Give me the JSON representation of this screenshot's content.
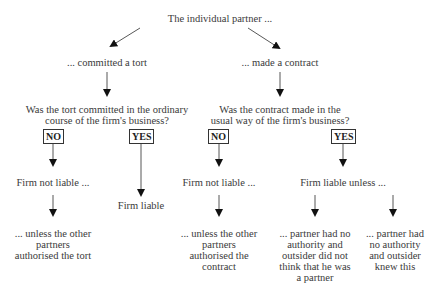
{
  "diagram": {
    "type": "decision-flowchart",
    "root": "The individual partner ...",
    "branches": [
      {
        "label": "... committed a tort",
        "question": [
          "Was the tort committed in the ordinary",
          "course of the firm's business?"
        ],
        "no": {
          "label": "NO",
          "result": "Firm not liable ...",
          "exception": [
            "... unless the other",
            "partners",
            "authorised the tort"
          ]
        },
        "yes": {
          "label": "YES",
          "result": "Firm liable"
        }
      },
      {
        "label": "... made a contract",
        "question": [
          "Was the contract made in the",
          "usual way of the firm's business?"
        ],
        "no": {
          "label": "NO",
          "result": "Firm not liable ...",
          "exception": [
            "... unless the other",
            "partners",
            "authorised the",
            "contract"
          ]
        },
        "yes": {
          "label": "YES",
          "result": "Firm liable unless ...",
          "exceptions": [
            [
              "... partner had no",
              "authority and",
              "outsider did not",
              "think that he was",
              "a partner"
            ],
            [
              "... partner had",
              "no authority",
              "and outsider",
              "knew this"
            ]
          ]
        }
      }
    ]
  }
}
